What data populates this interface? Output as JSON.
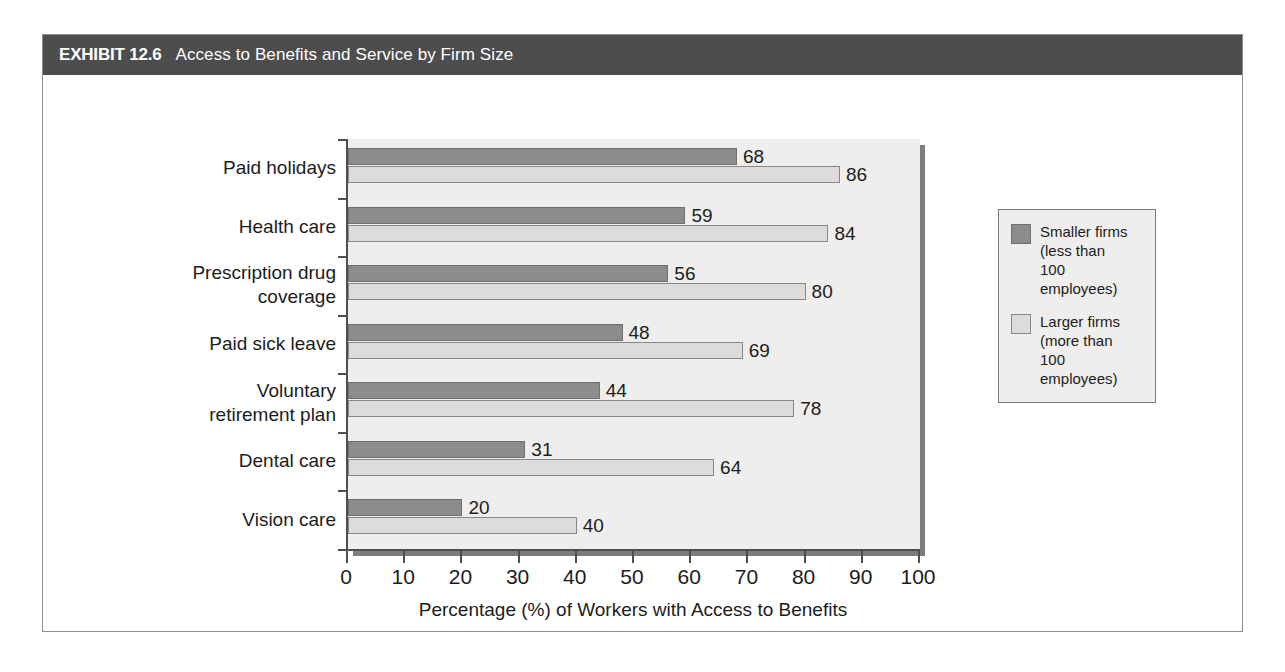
{
  "header": {
    "exhibit_label": "EXHIBIT 12.6",
    "title": "Access to Benefits and Service by Firm Size",
    "bar_color": "#4d4d4d",
    "text_color": "#ffffff"
  },
  "chart_data": {
    "type": "bar",
    "orientation": "horizontal",
    "title": "Access to Benefits and Service by Firm Size",
    "xlabel": "Percentage (%) of Workers with Access to Benefits",
    "ylabel": "",
    "xlim": [
      0,
      100
    ],
    "xticks": [
      0,
      10,
      20,
      30,
      40,
      50,
      60,
      70,
      80,
      90,
      100
    ],
    "grid": false,
    "legend_position": "right",
    "categories": [
      "Paid holidays",
      "Health care",
      "Prescription drug\ncoverage",
      "Paid sick leave",
      "Voluntary\nretirement plan",
      "Dental care",
      "Vision care"
    ],
    "series": [
      {
        "name": "Smaller firms (less than 100 employees)",
        "short_name": "Smaller firms",
        "color": "#8c8c8a",
        "values": [
          68,
          59,
          56,
          48,
          44,
          31,
          20
        ]
      },
      {
        "name": "Larger firms (more than 100 employees)",
        "short_name": "Larger firms",
        "color": "#dddcda",
        "values": [
          86,
          84,
          80,
          69,
          78,
          64,
          40
        ]
      }
    ]
  },
  "legend": {
    "items": [
      {
        "swatch": "small",
        "label": "Smaller firms\n(less than\n100 employees)"
      },
      {
        "swatch": "large",
        "label": "Larger firms\n(more than\n100 employees)"
      }
    ]
  }
}
